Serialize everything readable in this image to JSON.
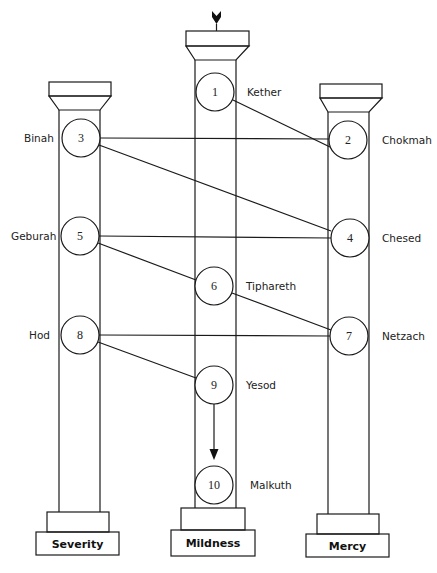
{
  "diagram": {
    "type": "tree-of-life-three-pillars",
    "pillars": [
      {
        "id": "left",
        "label": "Severity"
      },
      {
        "id": "center",
        "label": "Mildness"
      },
      {
        "id": "right",
        "label": "Mercy"
      }
    ],
    "sephiroth": [
      {
        "number": "1",
        "name": "Kether",
        "pillar": "center"
      },
      {
        "number": "2",
        "name": "Chokmah",
        "pillar": "right"
      },
      {
        "number": "3",
        "name": "Binah",
        "pillar": "left"
      },
      {
        "number": "4",
        "name": "Chesed",
        "pillar": "right"
      },
      {
        "number": "5",
        "name": "Geburah",
        "pillar": "left"
      },
      {
        "number": "6",
        "name": "Tiphareth",
        "pillar": "center"
      },
      {
        "number": "7",
        "name": "Netzach",
        "pillar": "right"
      },
      {
        "number": "8",
        "name": "Hod",
        "pillar": "left"
      },
      {
        "number": "9",
        "name": "Yesod",
        "pillar": "center"
      },
      {
        "number": "10",
        "name": "Malkuth",
        "pillar": "center"
      }
    ],
    "paths": [
      {
        "from": "1",
        "to": "2"
      },
      {
        "from": "2",
        "to": "3"
      },
      {
        "from": "3",
        "to": "4"
      },
      {
        "from": "4",
        "to": "5"
      },
      {
        "from": "5",
        "to": "6"
      },
      {
        "from": "6",
        "to": "7"
      },
      {
        "from": "7",
        "to": "8"
      },
      {
        "from": "8",
        "to": "9"
      },
      {
        "from": "9",
        "to": "10",
        "arrow": true
      }
    ],
    "top_icon": "descending-arrow-icon"
  }
}
